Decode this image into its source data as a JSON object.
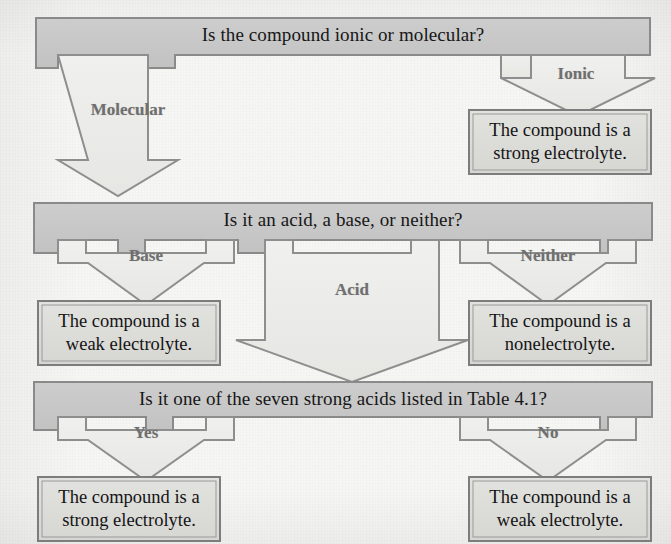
{
  "diagram": {
    "title_text": "Is the compound ionic or molecular?",
    "colors": {
      "banner_fill": "#c9c9c9",
      "banner_stroke": "#8a8a8a",
      "arrow_fill": "#ebebe9",
      "arrow_stroke": "#8e8e8e",
      "result_fill": "#dcdcda",
      "result_stroke": "#7d7d7d",
      "label_color": "#6f6f6f",
      "text_color": "#141414",
      "background": "#f6f6f4"
    }
  },
  "decisions": [
    {
      "id": "decision-ionic-or-molecular",
      "question": "Is the compound ionic or molecular?",
      "branches": [
        {
          "label": "Molecular"
        },
        {
          "label": "Ionic"
        }
      ]
    },
    {
      "id": "decision-acid-base-neither",
      "question": "Is it an acid, a base, or neither?",
      "branches": [
        {
          "label": "Base"
        },
        {
          "label": "Acid"
        },
        {
          "label": "Neither"
        }
      ]
    },
    {
      "id": "decision-seven-strong-acids",
      "question": "Is it one of the seven strong acids listed in Table 4.1?",
      "branches": [
        {
          "label": "Yes"
        },
        {
          "label": "No"
        }
      ]
    }
  ],
  "results": [
    {
      "id": "result-ionic",
      "line1": "The compound is a",
      "line2": "strong electrolyte."
    },
    {
      "id": "result-base",
      "line1": "The compound is a",
      "line2": "weak electrolyte."
    },
    {
      "id": "result-neither",
      "line1": "The compound is a",
      "line2": "nonelectrolyte."
    },
    {
      "id": "result-strong-acid",
      "line1": "The compound is a",
      "line2": "strong electrolyte."
    },
    {
      "id": "result-weak-acid",
      "line1": "The compound is a",
      "line2": "weak electrolyte."
    }
  ]
}
